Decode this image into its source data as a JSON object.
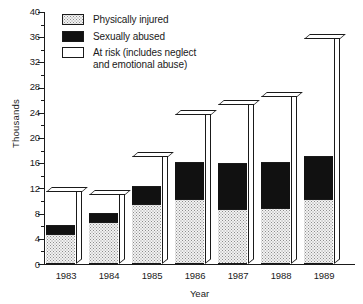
{
  "chart_data": {
    "type": "bar",
    "subtype": "stacked-vertical-3d",
    "title": "",
    "xlabel": "Year",
    "ylabel": "Thousands",
    "categories": [
      "1983",
      "1984",
      "1985",
      "1986",
      "1987",
      "1988",
      "1989"
    ],
    "series": [
      {
        "name": "Physically injured",
        "fill": "stipple-dotted",
        "color": "#f2f2f2",
        "values": [
          4.6,
          6.5,
          9.3,
          10.2,
          8.5,
          8.7,
          10.2
        ]
      },
      {
        "name": "Sexually abused",
        "fill": "solid-black",
        "color": "#111111",
        "values": [
          1.4,
          1.5,
          3.0,
          5.9,
          7.4,
          7.3,
          6.8
        ]
      },
      {
        "name": "At risk (includes neglect and emotional abuse)",
        "fill": "solid-white",
        "color": "#ffffff",
        "values": [
          5.5,
          3.0,
          4.7,
          7.5,
          9.3,
          10.5,
          18.7
        ]
      }
    ],
    "totals": [
      11.5,
      11.0,
      17.0,
      23.6,
      25.2,
      26.5,
      35.7
    ],
    "ylim": [
      0,
      40
    ],
    "ytick_major_step": 4,
    "ytick_minor_step": 2,
    "yticks": [
      "0",
      "4",
      "8",
      "12",
      "16",
      "20",
      "24",
      "28",
      "32",
      "36",
      "40"
    ],
    "grid": false,
    "legend_position": "upper-left-inside"
  },
  "axes": {
    "y_title": "Thousands",
    "x_title": "Year",
    "y_ticks": [
      "0",
      "4",
      "8",
      "12",
      "16",
      "20",
      "24",
      "28",
      "32",
      "36",
      "40"
    ],
    "x_ticks": [
      "1983",
      "1984",
      "1985",
      "1986",
      "1987",
      "1988",
      "1989"
    ]
  },
  "legend": {
    "items": [
      {
        "label": "Physically injured",
        "swatch": "physically-injured-swatch"
      },
      {
        "label": "Sexually abused",
        "swatch": "sexually-abused-swatch"
      },
      {
        "label": "At risk (includes neglect\nand emotional abuse)",
        "swatch": "at-risk-swatch"
      }
    ]
  }
}
